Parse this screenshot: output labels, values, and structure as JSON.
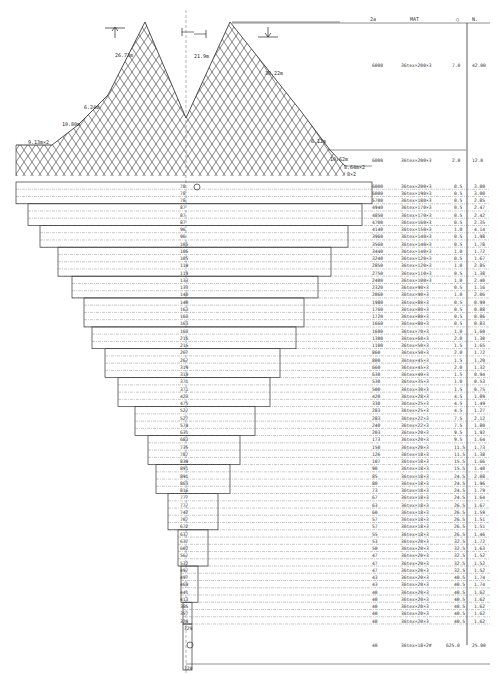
{
  "header": {
    "columns": [
      "2a",
      "MAT",
      "○",
      "N."
    ]
  },
  "upper": {
    "dimensions": {
      "left_wing_top": "26.73m",
      "center_gap": "21.9m",
      "right_wing_top": "38.22m",
      "left_side_1": "6.24m",
      "left_side_2": "10.80m",
      "left_side_3": "9.13m×2",
      "right_side_1": "6.12m",
      "right_side_2": "10.62m",
      "right_side_3": "8.64m×2",
      "right_side_4": "8×2"
    },
    "spec_rows": [
      {
        "a": "6000",
        "mat": "36tex×200×3",
        "mesh": "7.0",
        "n": "42.00"
      },
      {
        "a": "6000",
        "mat": "36tex×200×3",
        "mesh": "2.0",
        "n": "12.0"
      }
    ]
  },
  "body": {
    "rows": [
      {
        "c": "78",
        "a": "6000",
        "mat": "36tex×200×3",
        "mesh": "0.5",
        "n": "3.00"
      },
      {
        "c": "78",
        "a": "6000",
        "mat": "36tex×190×3",
        "mesh": "0.5",
        "n": "3.00"
      },
      {
        "c": "78",
        "a": "5700",
        "mat": "36tex×180×3",
        "mesh": "0.5",
        "n": "2.85"
      },
      {
        "c": "87",
        "a": "4940",
        "mat": "36tex×170×3",
        "mesh": "0.5",
        "n": "2.47"
      },
      {
        "c": "87",
        "a": "4850",
        "mat": "36tex×170×3",
        "mesh": "0.5",
        "n": "2.42"
      },
      {
        "c": "87",
        "a": "4700",
        "mat": "36tex×160×3",
        "mesh": "0.5",
        "n": "2.35"
      },
      {
        "c": "96",
        "a": "4140",
        "mat": "36tex×150×3",
        "mesh": "1.0",
        "n": "4.14"
      },
      {
        "c": "96",
        "a": "3960",
        "mat": "36tex×140×3",
        "mesh": "0.5",
        "n": "1.98"
      },
      {
        "c": "105",
        "a": "3560",
        "mat": "36tex×140×3",
        "mesh": "0.5",
        "n": "1.78"
      },
      {
        "c": "105",
        "a": "3440",
        "mat": "36tex×140×3",
        "mesh": "1.0",
        "n": "1.72"
      },
      {
        "c": "105",
        "a": "3240",
        "mat": "36tex×120×3",
        "mesh": "0.5",
        "n": "1.67"
      },
      {
        "c": "119",
        "a": "2850",
        "mat": "36tex×120×3",
        "mesh": "1.0",
        "n": "2.85"
      },
      {
        "c": "119",
        "a": "2750",
        "mat": "36tex×110×3",
        "mesh": "0.5",
        "n": "1.38"
      },
      {
        "c": "133",
        "a": "2400",
        "mat": "36tex×100×3",
        "mesh": "1.0",
        "n": "2.40"
      },
      {
        "c": "133",
        "a": "2320",
        "mat": "36tex×90×3",
        "mesh": "0.5",
        "n": "1.16"
      },
      {
        "c": "140",
        "a": "2060",
        "mat": "36tex×90×3",
        "mesh": "1.0",
        "n": "2.06"
      },
      {
        "c": "140",
        "a": "1980",
        "mat": "36tex×80×3",
        "mesh": "0.5",
        "n": "0.99"
      },
      {
        "c": "163",
        "a": "1760",
        "mat": "36tex×80×3",
        "mesh": "0.5",
        "n": "0.88"
      },
      {
        "c": "163",
        "a": "1720",
        "mat": "36tex×80×3",
        "mesh": "0.5",
        "n": "0.86"
      },
      {
        "c": "163",
        "a": "1660",
        "mat": "36tex×80×3",
        "mesh": "0.5",
        "n": "0.83"
      },
      {
        "c": "163",
        "a": "1600",
        "mat": "36tex×70×3",
        "mesh": "1.0",
        "n": "1.60"
      },
      {
        "c": "216",
        "a": "1300",
        "mat": "36tex×60×3",
        "mesh": "2.0",
        "n": "1.30"
      },
      {
        "c": "215",
        "a": "1100",
        "mat": "36tex×50×3",
        "mesh": "1.5",
        "n": "1.65"
      },
      {
        "c": "267",
        "a": "860",
        "mat": "36tex×50×3",
        "mesh": "2.0",
        "n": "1.72"
      },
      {
        "c": "267",
        "a": "800",
        "mat": "36tex×45×3",
        "mesh": "1.5",
        "n": "1.20"
      },
      {
        "c": "319",
        "a": "660",
        "mat": "36tex×45×3",
        "mesh": "2.0",
        "n": "1.32"
      },
      {
        "c": "319",
        "a": "630",
        "mat": "36tex×40×3",
        "mesh": "1.5",
        "n": "0.94"
      },
      {
        "c": "371",
        "a": "530",
        "mat": "36tex×35×3",
        "mesh": "1.0",
        "n": "0.53"
      },
      {
        "c": "371",
        "a": "500",
        "mat": "36tex×30×3",
        "mesh": "1.5",
        "n": "0.75"
      },
      {
        "c": "423",
        "a": "420",
        "mat": "36tex×28×3",
        "mesh": "4.5",
        "n": "1.89"
      },
      {
        "c": "475",
        "a": "330",
        "mat": "36tex×25×3",
        "mesh": "4.5",
        "n": "1.49"
      },
      {
        "c": "527",
        "a": "283",
        "mat": "36tex×25×3",
        "mesh": "4.5",
        "n": "1.27"
      },
      {
        "c": "527",
        "a": "283",
        "mat": "36tex×22×3",
        "mesh": "7.5",
        "n": "2.12"
      },
      {
        "c": "579",
        "a": "240",
        "mat": "36tex×22×3",
        "mesh": "7.5",
        "n": "1.80"
      },
      {
        "c": "631",
        "a": "203",
        "mat": "36tex×20×3",
        "mesh": "9.5",
        "n": "1.92"
      },
      {
        "c": "683",
        "a": "173",
        "mat": "36tex×20×3",
        "mesh": "9.5",
        "n": "1.64"
      },
      {
        "c": "735",
        "a": "150",
        "mat": "36tex×20×3",
        "mesh": "11.5",
        "n": "1.73"
      },
      {
        "c": "787",
        "a": "126",
        "mat": "36tex×18×3",
        "mesh": "11.5",
        "n": "1.38"
      },
      {
        "c": "839",
        "a": "107",
        "mat": "36tex×18×3",
        "mesh": "15.5",
        "n": "1.66"
      },
      {
        "c": "891",
        "a": "90",
        "mat": "36tex×18×3",
        "mesh": "15.5",
        "n": "1.40"
      },
      {
        "c": "891",
        "a": "85",
        "mat": "36tex×18×3",
        "mesh": "24.5",
        "n": "2.08"
      },
      {
        "c": "863",
        "a": "80",
        "mat": "36tex×18×3",
        "mesh": "24.5",
        "n": "1.96"
      },
      {
        "c": "816",
        "a": "73",
        "mat": "36tex×18×3",
        "mesh": "24.5",
        "n": "1.79"
      },
      {
        "c": "777",
        "a": "67",
        "mat": "36tex×18×3",
        "mesh": "24.5",
        "n": "1.64"
      },
      {
        "c": "777",
        "a": "63",
        "mat": "36tex×18×3",
        "mesh": "26.5",
        "n": "1.67"
      },
      {
        "c": "742",
        "a": "60",
        "mat": "36tex×18×3",
        "mesh": "26.5",
        "n": "1.59"
      },
      {
        "c": "707",
        "a": "57",
        "mat": "36tex×18×3",
        "mesh": "26.5",
        "n": "1.51"
      },
      {
        "c": "672",
        "a": "57",
        "mat": "36tex×18×3",
        "mesh": "26.5",
        "n": "1.51"
      },
      {
        "c": "637",
        "a": "55",
        "mat": "36tex×18×3",
        "mesh": "26.5",
        "n": "1.46"
      },
      {
        "c": "637",
        "a": "53",
        "mat": "36tex×20×3",
        "mesh": "32.5",
        "n": "1.72"
      },
      {
        "c": "602",
        "a": "50",
        "mat": "36tex×20×3",
        "mesh": "32.5",
        "n": "1.63"
      },
      {
        "c": "567",
        "a": "47",
        "mat": "36tex×20×3",
        "mesh": "32.5",
        "n": "1.52"
      },
      {
        "c": "532",
        "a": "47",
        "mat": "36tex×20×3",
        "mesh": "32.5",
        "n": "1.52"
      },
      {
        "c": "497",
        "a": "47",
        "mat": "36tex×20×3",
        "mesh": "32.5",
        "n": "1.52"
      },
      {
        "c": "497",
        "a": "43",
        "mat": "36tex×20×3",
        "mesh": "40.5",
        "n": "1.74"
      },
      {
        "c": "469",
        "a": "43",
        "mat": "36tex×20×3",
        "mesh": "40.5",
        "n": "1.74"
      },
      {
        "c": "441",
        "a": "40",
        "mat": "36tex×20×3",
        "mesh": "40.5",
        "n": "1.62"
      },
      {
        "c": "413",
        "a": "40",
        "mat": "36tex×20×3",
        "mesh": "40.5",
        "n": "1.62"
      },
      {
        "c": "385",
        "a": "40",
        "mat": "36tex×20×3",
        "mesh": "40.5",
        "n": "1.62"
      },
      {
        "c": "357",
        "a": "40",
        "mat": "36tex×20×3",
        "mesh": "40.5",
        "n": "1.62"
      },
      {
        "c": "329",
        "a": "40",
        "mat": "36tex×20×3",
        "mesh": "40.5",
        "n": "1.62"
      }
    ],
    "codend": {
      "c_top": "329",
      "c_bottom": "329",
      "a": "40",
      "mat": "36tex×18×2#",
      "mesh": "625.0",
      "n": "25.00"
    }
  }
}
